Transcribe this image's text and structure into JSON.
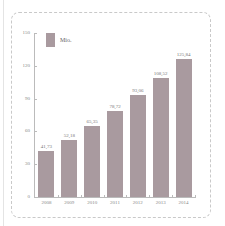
{
  "chart_data": {
    "type": "bar",
    "title": "",
    "xlabel": "",
    "ylabel": "",
    "categories": [
      "2008",
      "2009",
      "2010",
      "2011",
      "2012",
      "2013",
      "2014"
    ],
    "values": [
      41.73,
      52.18,
      65.35,
      78.72,
      93.06,
      108.52,
      125.84
    ],
    "value_labels": [
      "41,73",
      "52,18",
      "65,35",
      "78,72",
      "93,06",
      "108,52",
      "125,84"
    ],
    "series": [
      {
        "name": "Mio.",
        "values": [
          41.73,
          52.18,
          65.35,
          78.72,
          93.06,
          108.52,
          125.84
        ]
      }
    ],
    "ylim": [
      0,
      150
    ],
    "yticks": [
      0,
      30,
      60,
      90,
      120,
      150
    ],
    "legend_position": "top-left",
    "grid": false,
    "bar_color": "#a99a9f"
  },
  "legend": {
    "label": "Mio."
  }
}
